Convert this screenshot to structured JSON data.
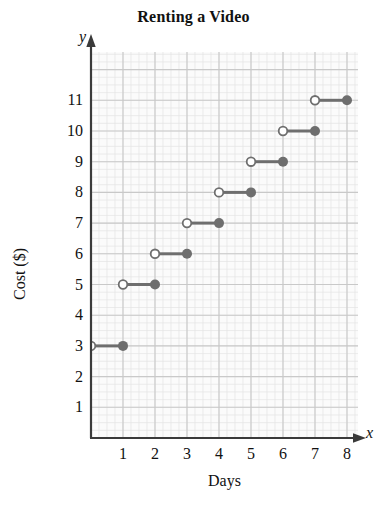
{
  "chart_data": {
    "type": "line",
    "title": "Renting a Video",
    "xlabel": "Days",
    "ylabel": "Cost ($)",
    "x_axis_letter": "x",
    "y_axis_letter": "y",
    "xlim": [
      0,
      8.4
    ],
    "ylim": [
      0,
      12.6
    ],
    "xticks": [
      "1",
      "2",
      "3",
      "4",
      "5",
      "6",
      "7",
      "8"
    ],
    "xtick_values": [
      1,
      2,
      3,
      4,
      5,
      6,
      7,
      8
    ],
    "yticks": [
      "1",
      "2",
      "3",
      "4",
      "5",
      "6",
      "7",
      "8",
      "9",
      "10",
      "11"
    ],
    "ytick_values": [
      1,
      2,
      3,
      4,
      5,
      6,
      7,
      8,
      9,
      10,
      11
    ],
    "grid": true,
    "minor_grid": true,
    "minor_grid_divisions": 4,
    "legend": null,
    "series": [
      {
        "name": "Cost of renting a video",
        "style": "step",
        "color": "#6e6e6e",
        "left_endpoint": "open",
        "right_endpoint": "closed",
        "segments": [
          {
            "x_start": 0,
            "x_end": 1,
            "y": 3
          },
          {
            "x_start": 1,
            "x_end": 2,
            "y": 5
          },
          {
            "x_start": 2,
            "x_end": 3,
            "y": 6
          },
          {
            "x_start": 3,
            "x_end": 4,
            "y": 7
          },
          {
            "x_start": 4,
            "x_end": 5,
            "y": 8
          },
          {
            "x_start": 5,
            "x_end": 6,
            "y": 9
          },
          {
            "x_start": 6,
            "x_end": 7,
            "y": 10
          },
          {
            "x_start": 7,
            "x_end": 8,
            "y": 11
          }
        ]
      }
    ],
    "colors": {
      "data": "#6e6e6e",
      "axis": "#3a3a3a",
      "major_grid": "#c9c9c9",
      "minor_grid": "#e4e4e4",
      "plot_background": "#fbfbfb",
      "text": "#111111"
    }
  }
}
